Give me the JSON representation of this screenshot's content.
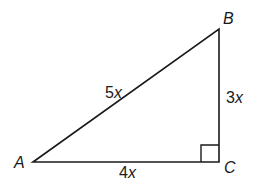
{
  "figure": {
    "type": "right-triangle",
    "vertices": {
      "A": {
        "label": "A",
        "x": 33,
        "y": 162
      },
      "B": {
        "label": "B",
        "x": 219,
        "y": 29
      },
      "C": {
        "label": "C",
        "x": 219,
        "y": 162
      }
    },
    "sides": {
      "AB": {
        "coef": "5",
        "var": "x"
      },
      "BC": {
        "coef": "3",
        "var": "x"
      },
      "AC": {
        "coef": "4",
        "var": "x"
      }
    },
    "right_angle_at": "C",
    "colors": {
      "stroke": "#1a1a1a",
      "background": "#ffffff"
    }
  }
}
